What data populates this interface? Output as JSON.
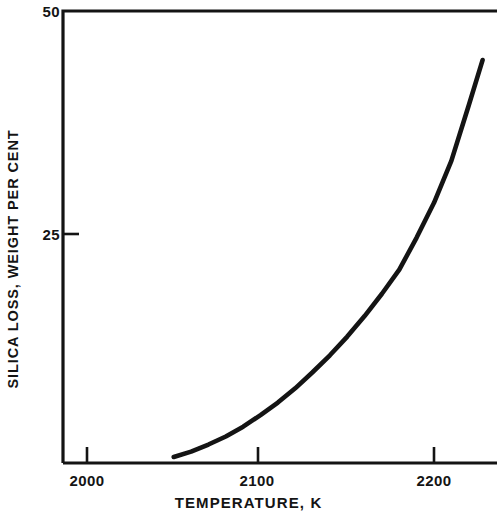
{
  "chart_data": {
    "type": "line",
    "title": "",
    "xlabel": "TEMPERATURE, K",
    "ylabel": "SILICA LOSS, WEIGHT PER CENT",
    "xlim": [
      1975,
      2240
    ],
    "ylim": [
      0,
      50
    ],
    "grid": false,
    "legend": null,
    "xticks": [
      {
        "value": 2000,
        "label": "2000"
      },
      {
        "value": 2100,
        "label": "2100"
      },
      {
        "value": 2200,
        "label": "2200"
      }
    ],
    "yticks": [
      {
        "value": 25,
        "label": "25"
      },
      {
        "value": 50,
        "label": "50"
      }
    ],
    "series": [
      {
        "name": "silica loss",
        "x": [
          2050,
          2060,
          2070,
          2080,
          2090,
          2100,
          2110,
          2120,
          2130,
          2140,
          2150,
          2160,
          2170,
          2180,
          2190,
          2200,
          2210,
          2220,
          2228
        ],
        "values": [
          0.0,
          0.6,
          1.4,
          2.3,
          3.4,
          4.7,
          6.1,
          7.7,
          9.5,
          11.4,
          13.5,
          15.8,
          18.3,
          21.0,
          24.6,
          28.5,
          33.2,
          39.4,
          44.5
        ]
      }
    ],
    "line_color": "#141414",
    "line_width": 4.6,
    "axis_color": "#141414",
    "background": "#ffffff"
  },
  "axes": {
    "y_axis_name": "silica-loss-axis",
    "x_axis_name": "temperature-axis"
  }
}
